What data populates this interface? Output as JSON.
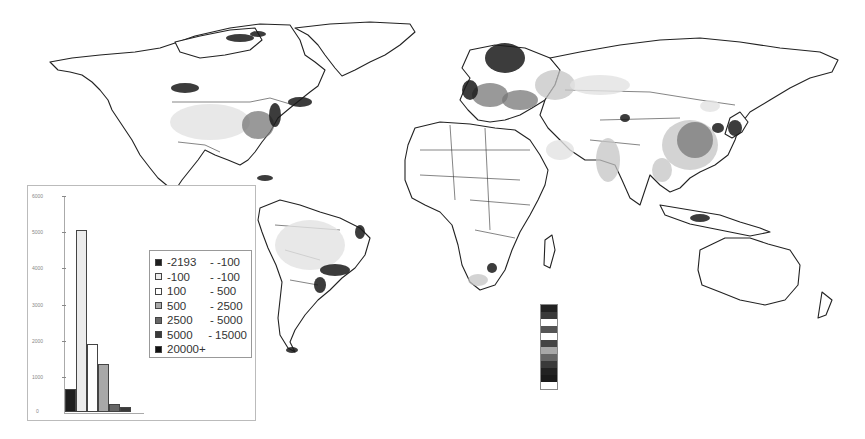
{
  "chart_data": {
    "type": "bar",
    "title": "",
    "xlabel": "",
    "ylabel": "",
    "ylim": [
      0,
      6000
    ],
    "y_ticks": [
      "6000",
      "5000",
      "4000",
      "3000",
      "2000",
      "1000",
      "0"
    ],
    "grid": false,
    "legend_position": "right-inside",
    "categories": [
      "-2193 - -100",
      "-100 - -100",
      "100 - 500",
      "500 - 2500",
      "2500 - 5000",
      "5000 - 15000",
      "20000+"
    ],
    "values": [
      640,
      5030,
      1890,
      1330,
      230,
      130,
      0
    ],
    "colors": [
      "#1e1e1e",
      "#ececec",
      "#ffffff",
      "#a8a8a8",
      "#666666",
      "#3a3a3a",
      "#111111"
    ],
    "annotations": [
      "World map choropleth with grayscale classes",
      "Vertical color-scale strip below Africa"
    ]
  },
  "legend": {
    "items": [
      {
        "from": "-2193",
        "sep": "-",
        "to": "-100",
        "color": "#1e1e1e"
      },
      {
        "from": "-100",
        "sep": "-",
        "to": "-100",
        "color": "#ececec"
      },
      {
        "from": "100",
        "sep": "-",
        "to": "500",
        "color": "#ffffff"
      },
      {
        "from": "500",
        "sep": "-",
        "to": "2500",
        "color": "#a8a8a8"
      },
      {
        "from": "2500",
        "sep": "-",
        "to": "5000",
        "color": "#666666"
      },
      {
        "from": "5000",
        "sep": "-",
        "to": "15000",
        "color": "#3a3a3a"
      },
      {
        "from": "20000+",
        "sep": "",
        "to": "",
        "color": "#111111"
      }
    ]
  },
  "scale_strip": {
    "colors": [
      "#222222",
      "#3a3a3a",
      "#ffffff",
      "#555555",
      "#ffffff",
      "#444444",
      "#a8a8a8",
      "#666666",
      "#3a3a3a",
      "#222222",
      "#1a1a1a",
      "#ffffff"
    ]
  }
}
